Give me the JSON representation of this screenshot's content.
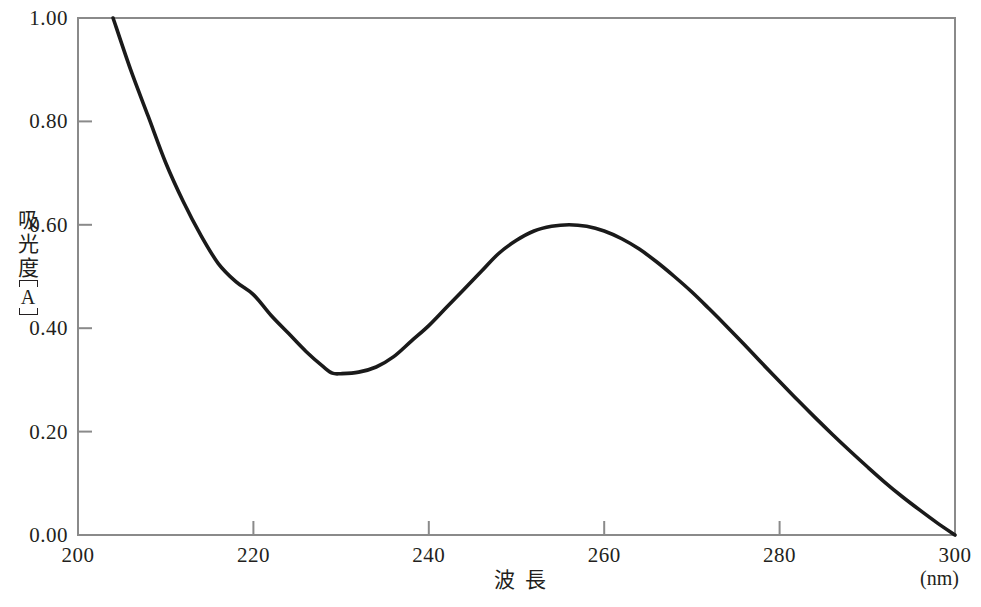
{
  "chart_data": {
    "type": "line",
    "title": "",
    "xlabel": "波 長",
    "xunit": "(nm)",
    "ylabel": "吸光度",
    "yunit": "[A]",
    "xlim": [
      200,
      300
    ],
    "ylim": [
      0.0,
      1.0
    ],
    "xticks": [
      200,
      220,
      240,
      260,
      280,
      300
    ],
    "xtick_labels": [
      "200",
      "220",
      "240",
      "260",
      "280",
      "300"
    ],
    "yticks": [
      0.0,
      0.2,
      0.4,
      0.6,
      0.8,
      1.0
    ],
    "ytick_labels": [
      "0.00",
      "0.20",
      "0.40",
      "0.60",
      "0.80",
      "1.00"
    ],
    "grid": false,
    "legend": null,
    "series": [
      {
        "name": "absorbance",
        "color": "#1a1a1a",
        "x": [
          204,
          206,
          208,
          210,
          212,
          214,
          216,
          218,
          220,
          222,
          224,
          226,
          228,
          229,
          230,
          232,
          234,
          236,
          238,
          240,
          242,
          244,
          246,
          248,
          250,
          252,
          254,
          256,
          258,
          260,
          262,
          264,
          266,
          268,
          270,
          272,
          274,
          276,
          278,
          280,
          282,
          284,
          286,
          288,
          290,
          292,
          294,
          296,
          298,
          300
        ],
        "y": [
          1.0,
          0.9,
          0.81,
          0.72,
          0.645,
          0.58,
          0.525,
          0.49,
          0.465,
          0.425,
          0.39,
          0.355,
          0.325,
          0.313,
          0.312,
          0.315,
          0.325,
          0.345,
          0.375,
          0.405,
          0.44,
          0.475,
          0.51,
          0.545,
          0.57,
          0.588,
          0.597,
          0.6,
          0.597,
          0.588,
          0.573,
          0.553,
          0.528,
          0.5,
          0.47,
          0.437,
          0.403,
          0.368,
          0.332,
          0.297,
          0.262,
          0.228,
          0.195,
          0.163,
          0.132,
          0.102,
          0.074,
          0.048,
          0.023,
          0.0
        ]
      }
    ],
    "annotations": {
      "peak": {
        "x": 256,
        "y": 0.6
      },
      "minimum": {
        "x": 229,
        "y": 0.31
      }
    }
  },
  "axes": {
    "frame_color": "#8a8a8a",
    "curve_color": "#1a1a1a"
  },
  "ylabel_chars": [
    "吸",
    "光",
    "度"
  ],
  "ylabel_unit_letter": "A",
  "xlabel_chars": [
    "波",
    "長"
  ]
}
